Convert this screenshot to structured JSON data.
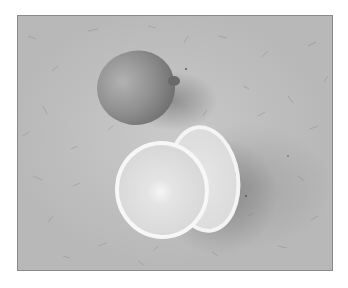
{
  "image": {
    "description": "Grayscale photograph of a whole lemon and two halved slices on textured fibrous paper",
    "subjects": [
      "whole-lemon",
      "lemon-half-front",
      "lemon-half-back"
    ],
    "colors": {
      "border": "#8a8a8a",
      "background_paper": "#bdbdbd",
      "frame": "#ffffff"
    }
  }
}
